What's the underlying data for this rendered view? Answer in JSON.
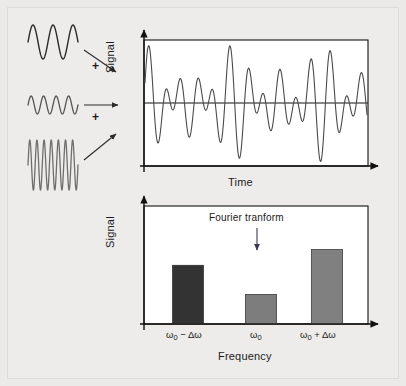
{
  "figure": {
    "background_color": "#eceae8",
    "outer_border_color": "#d9d7d4"
  },
  "inputs": {
    "plus_sign_1": "+",
    "plus_sign_2": "+",
    "waves": [
      {
        "name": "low-frequency-wave",
        "cycles": 2.5,
        "amplitude": 17,
        "color": "#2b2b2b",
        "stroke": 1.4
      },
      {
        "name": "mid-frequency-wave",
        "cycles": 4.0,
        "amplitude": 9,
        "color": "#555555",
        "stroke": 1.3
      },
      {
        "name": "high-frequency-wave",
        "cycles": 7.0,
        "amplitude": 25,
        "color": "#6e6e6e",
        "stroke": 1.3
      }
    ],
    "arrows": [
      {
        "name": "arrow-from-low-wave"
      },
      {
        "name": "arrow-from-mid-wave"
      },
      {
        "name": "arrow-from-high-wave"
      }
    ]
  },
  "chart_data": [
    {
      "type": "line",
      "name": "time-domain-signal",
      "title": "",
      "xlabel": "Time",
      "ylabel": "Signal",
      "grid": false,
      "zero_line": true,
      "legend": "none",
      "xlim": [
        0,
        1
      ],
      "ylim": [
        -1,
        1
      ],
      "series": [
        {
          "name": "composite-signal",
          "color": "#4a4a4a",
          "description": "Sum of three sinusoids at w0-dw, w0 and w0+dw producing a beat pattern",
          "components": [
            {
              "frequency_cycles": 8.5,
              "amplitude": 0.33
            },
            {
              "frequency_cycles": 11.0,
              "amplitude": 0.2
            },
            {
              "frequency_cycles": 13.5,
              "amplitude": 0.42
            }
          ]
        }
      ]
    },
    {
      "type": "bar",
      "name": "frequency-domain-spectrum",
      "title": "",
      "xlabel": "Frequency",
      "ylabel": "Signal",
      "grid": false,
      "legend": "none",
      "annotation": "Fourier tranform",
      "annotation_arrow": "down-arrow",
      "categories": [
        "ω₀ − Δω",
        "ω₀",
        "ω₀ + Δω"
      ],
      "values": [
        0.52,
        0.26,
        0.66
      ],
      "ylim": [
        0,
        1
      ],
      "bar_colors": [
        "#333333",
        "#7d7d7d",
        "#808080"
      ]
    }
  ],
  "labels": {
    "signal_top": "Signal",
    "signal_bottom": "Signal",
    "time": "Time",
    "frequency": "Frequency",
    "fourier": "Fourier tranform",
    "tick_omega_minus_pre": "ω",
    "tick_omega_minus_sub": "0",
    "tick_omega_minus_post": " − Δω",
    "tick_omega_pre": "ω",
    "tick_omega_sub": "0",
    "tick_omega_post": "",
    "tick_omega_plus_pre": "ω",
    "tick_omega_plus_sub": "0",
    "tick_omega_plus_post": " + Δω"
  }
}
